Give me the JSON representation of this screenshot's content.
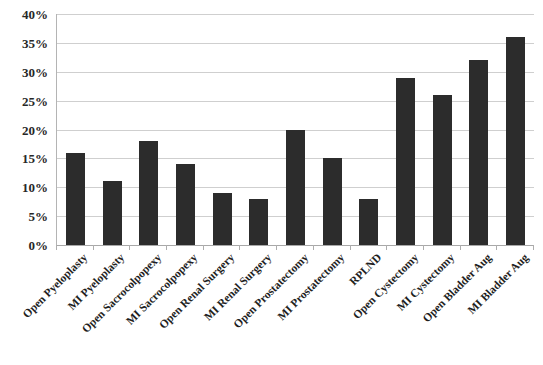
{
  "chart_data": {
    "type": "bar",
    "title": "",
    "xlabel": "",
    "ylabel": "",
    "ylim": [
      0,
      0.4
    ],
    "grid": true,
    "legend": false,
    "y_tick_labels": [
      "40%",
      "35%",
      "30%",
      "25%",
      "20%",
      "15%",
      "10%",
      "5%",
      "0%"
    ],
    "y_tick_values": [
      0.4,
      0.35,
      0.3,
      0.25,
      0.2,
      0.15,
      0.1,
      0.05,
      0.0
    ],
    "categories": [
      "Open Pyeloplasty",
      "MI Pyeloplasty",
      "Open Sacrocolpopexy",
      "MI Sacrocolpopexy",
      "Open Renal Surgery",
      "MI Renal Surgery",
      "Open Prostatectomy",
      "MI Prostatectomy",
      "RPLND",
      "Open Cystectomy",
      "MI Cystectomy",
      "Open Bladder Aug",
      "MI Bladder Aug"
    ],
    "values": [
      0.16,
      0.11,
      0.18,
      0.14,
      0.09,
      0.08,
      0.2,
      0.15,
      0.08,
      0.29,
      0.26,
      0.32,
      0.36
    ],
    "value_labels": [
      "16%",
      "11%",
      "18%",
      "14%",
      "9%",
      "8%",
      "20%",
      "15%",
      "8%",
      "29%",
      "26%",
      "32%",
      "36%"
    ],
    "bar_color": "#2c2c2c",
    "gridline_color": "#cfcfcf",
    "axis_color": "#a8a8a8",
    "background_color": "#ffffff"
  }
}
